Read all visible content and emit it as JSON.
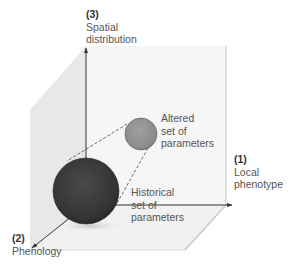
{
  "figure": {
    "axes": [
      {
        "id": "1",
        "number": "(1)",
        "line1": "Local",
        "line2": "phenotype"
      },
      {
        "id": "2",
        "number": "(2)",
        "line1": "Phenology",
        "line2": ""
      },
      {
        "id": "3",
        "number": "(3)",
        "line1": "Spatial",
        "line2": "distribution"
      }
    ],
    "spheres": [
      {
        "id": "altered",
        "line1": "Altered",
        "line2": "set of",
        "line3": "parameters",
        "color": "#8f8f8f"
      },
      {
        "id": "historical",
        "line1": "Historical",
        "line2": "set of",
        "line3": "parameters",
        "color": "#3a3a3a"
      }
    ],
    "colors": {
      "left_wall": "#e9e9e9",
      "back_wall": "#f6f6f6",
      "floor": "#f3f3f3",
      "edge": "#cfcfcf",
      "axis": "#333333"
    }
  }
}
